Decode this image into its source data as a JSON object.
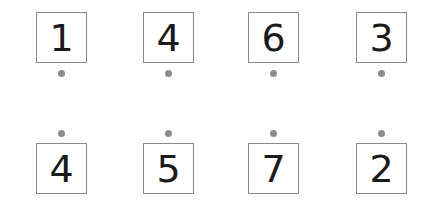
{
  "top_row": {
    "cards": [
      {
        "value": "1"
      },
      {
        "value": "4"
      },
      {
        "value": "6"
      },
      {
        "value": "3"
      }
    ]
  },
  "bottom_row": {
    "cards": [
      {
        "value": "4"
      },
      {
        "value": "5"
      },
      {
        "value": "7"
      },
      {
        "value": "2"
      }
    ]
  },
  "colors": {
    "card_border": "#8a8a8a",
    "digit": "#1a1a1a",
    "dot": "#8c8c8c"
  }
}
